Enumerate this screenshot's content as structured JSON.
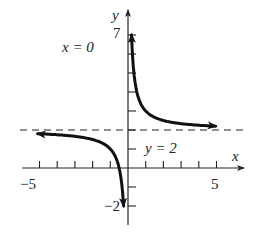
{
  "chart_data": {
    "type": "line",
    "title": "",
    "function": "y = 2 + 1/x",
    "xlabel": "x",
    "ylabel": "y",
    "xlim": [
      -5.5,
      6
    ],
    "ylim": [
      -2.5,
      8
    ],
    "x_ticks": [
      -5,
      -4,
      -3,
      -2,
      -1,
      1,
      2,
      3,
      4,
      5
    ],
    "y_ticks": [
      -2,
      -1,
      1,
      2,
      3,
      4,
      5,
      6,
      7
    ],
    "x_tick_labels": [
      {
        "value": -5,
        "label": "−5"
      },
      {
        "value": 5,
        "label": "5"
      }
    ],
    "y_tick_labels": [
      {
        "value": 7,
        "label": "7"
      },
      {
        "value": -2,
        "label": "−2"
      }
    ],
    "grid": false,
    "asymptotes": [
      {
        "type": "vertical",
        "value": 0,
        "label": "x = 0"
      },
      {
        "type": "horizontal",
        "value": 2,
        "label": "y = 2",
        "style": "dashed"
      }
    ],
    "series": [
      {
        "name": "right-branch",
        "x": [
          0.15,
          0.2,
          0.3,
          0.5,
          0.75,
          1,
          1.5,
          2,
          3,
          4,
          4.9
        ],
        "y": [
          8.67,
          7,
          5.33,
          4,
          3.33,
          3,
          2.67,
          2.5,
          2.33,
          2.25,
          2.2
        ]
      },
      {
        "name": "left-branch",
        "x": [
          -5,
          -4,
          -3,
          -2,
          -1.5,
          -1,
          -0.75,
          -0.5,
          -0.4,
          -0.3,
          -0.25
        ],
        "y": [
          1.8,
          1.75,
          1.67,
          1.5,
          1.33,
          1,
          0.67,
          0,
          -0.5,
          -1.33,
          -2
        ]
      }
    ]
  },
  "labels": {
    "x_axis": "x",
    "y_axis": "y",
    "vertical_asymptote": "x = 0",
    "horizontal_asymptote": "y = 2",
    "x_min_tick": "−5",
    "x_max_tick": "5",
    "y_max_tick": "7",
    "y_min_tick": "−2"
  }
}
